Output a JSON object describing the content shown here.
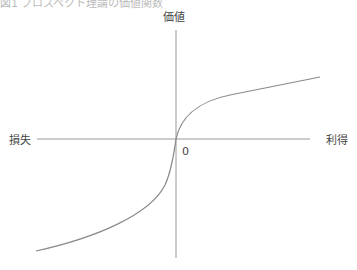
{
  "caption_partial": "図1 プロスペクト理論の価値関数",
  "diagram": {
    "axes": {
      "y_label": "価値",
      "x_negative_label": "損失",
      "x_positive_label": "利得",
      "origin_label": "0"
    },
    "colors": {
      "axis": "#9a9a9a",
      "curve": "#8a8a8a",
      "text": "#444444"
    }
  }
}
